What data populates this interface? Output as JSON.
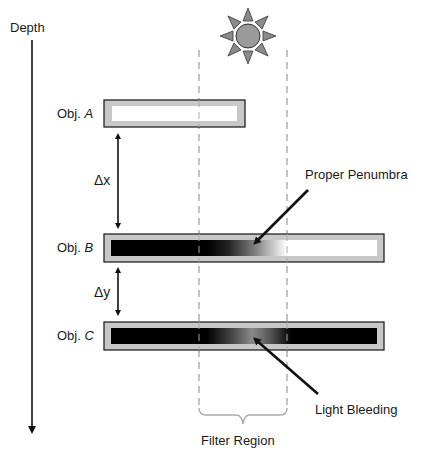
{
  "axis": {
    "label": "Depth"
  },
  "objects": [
    {
      "prefix": "Obj. ",
      "letter": "A",
      "fill": "white"
    },
    {
      "prefix": "Obj. ",
      "letter": "B",
      "fill": "black-to-white gradient"
    },
    {
      "prefix": "Obj. ",
      "letter": "C",
      "fill": "black with gray center"
    }
  ],
  "distances": {
    "dx": "Δx",
    "dy": "Δy"
  },
  "annotations": {
    "penumbra": "Proper Penumbra",
    "bleeding": "Light Bleeding",
    "filter": "Filter Region"
  },
  "icons": {
    "light_source": "sun-icon"
  },
  "colors": {
    "frame": "#c8c8c8",
    "border": "#222222",
    "dashed": "#aaaaaa",
    "sun": "#9a9a9a"
  }
}
